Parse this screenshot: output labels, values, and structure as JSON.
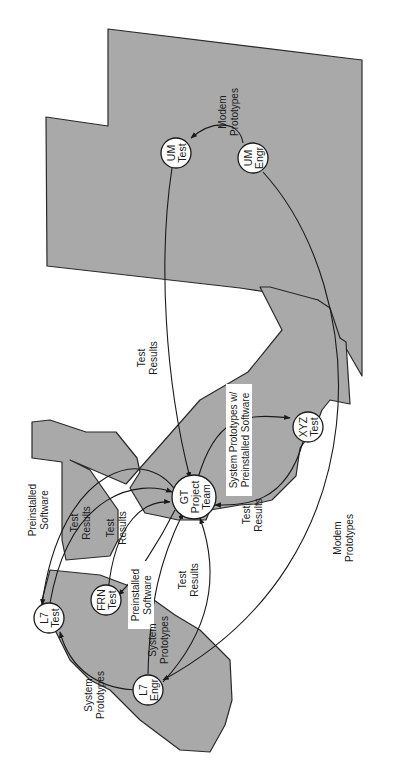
{
  "diagram": {
    "orientation": "rotated-90-ccw",
    "colors": {
      "region_fill": "#a9a9a9",
      "region_stroke": "#2a2a2a",
      "node_fill": "#ffffff",
      "line": "#1a1a1a"
    },
    "nodes": [
      {
        "id": "um-test",
        "line1": "UM",
        "line2": "Test"
      },
      {
        "id": "um-engr",
        "line1": "UM",
        "line2": "Engr"
      },
      {
        "id": "gt-team",
        "line1": "GT",
        "line2": "Project",
        "line3": "Team"
      },
      {
        "id": "xyz-test",
        "line1": "XYZ",
        "line2": "Test"
      },
      {
        "id": "l7-test",
        "line1": "L7",
        "line2": "Test"
      },
      {
        "id": "frn-test",
        "line1": "FRN",
        "line2": "Test"
      },
      {
        "id": "l7-engr",
        "line1": "L7",
        "line2": "Engr"
      }
    ],
    "flows": [
      {
        "id": "um-engr-to-um-test",
        "line1": "Modem",
        "line2": "Prototypes"
      },
      {
        "id": "um-test-to-gt",
        "line1": "Test",
        "line2": "Results"
      },
      {
        "id": "gt-to-xyz",
        "line1": "System Prototypes w/",
        "line2": "Preinstalled Software"
      },
      {
        "id": "xyz-to-gt",
        "line1": "Test",
        "line2": "Results"
      },
      {
        "id": "um-engr-to-l7-engr",
        "line1": "Modem",
        "line2": "Prototypes"
      },
      {
        "id": "gt-to-l7-test",
        "line1": "Preinstalled",
        "line2": "Software"
      },
      {
        "id": "l7-test-to-gt",
        "line1": "Test",
        "line2": "Results"
      },
      {
        "id": "frn-to-gt",
        "line1": "Test",
        "line2": "Results"
      },
      {
        "id": "gt-to-frn",
        "line1": "Preinstalled",
        "line2": "Software"
      },
      {
        "id": "l7-engr-to-gt-sys",
        "line1": "System",
        "line2": "Prototypes"
      },
      {
        "id": "l7-engr-to-gt-results",
        "line1": "Test",
        "line2": "Results"
      },
      {
        "id": "l7-engr-to-l7-test",
        "line1": "System",
        "line2": "Prototypes"
      }
    ]
  }
}
